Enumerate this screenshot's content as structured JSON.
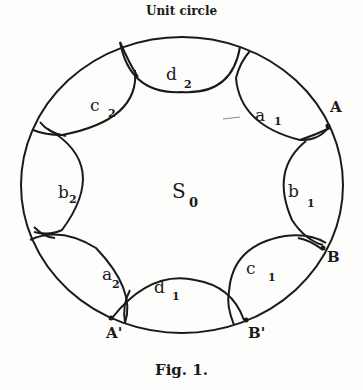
{
  "title": "Unit circle",
  "caption": "Fig. 1.",
  "center_label": {
    "main": "S",
    "sub": "0"
  },
  "regions": [
    {
      "main": "a",
      "sub": "1"
    },
    {
      "main": "b",
      "sub": "1"
    },
    {
      "main": "c",
      "sub": "1"
    },
    {
      "main": "d",
      "sub": "1"
    },
    {
      "main": "a",
      "sub": "2"
    },
    {
      "main": "b",
      "sub": "2"
    },
    {
      "main": "c",
      "sub": "2"
    },
    {
      "main": "d",
      "sub": "2"
    }
  ],
  "points": {
    "A": "A",
    "B": "B",
    "A_prime": "A'",
    "B_prime": "B'"
  },
  "colors": {
    "ink": "#1a1a1a",
    "paper": "#fdfdfb"
  }
}
